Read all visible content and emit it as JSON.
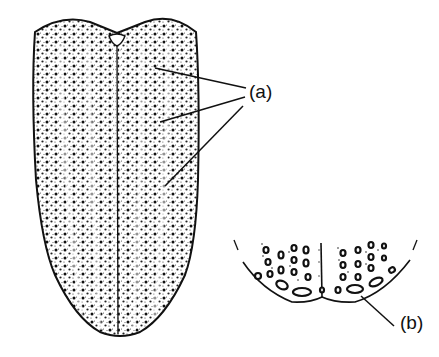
{
  "figure": {
    "colors": {
      "ink": "#111111",
      "background": "#ffffff"
    },
    "labels": [
      {
        "id": "a",
        "text": "(a)",
        "points_to": "rows of punctures (striae) on elytra",
        "leader_count": 3
      },
      {
        "id": "b",
        "text": "(b)",
        "points_to": "enlarged apical puncture in inset"
      }
    ],
    "parts": {
      "main": "elytra, dorsal view, with central suture and scutellum notch",
      "inset": "enlarged apex of elytra showing large oval punctures"
    }
  }
}
